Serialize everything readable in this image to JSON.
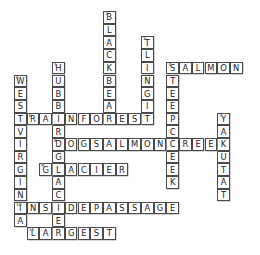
{
  "puzzle": {
    "title": "Crossword Grid",
    "grid": {
      "cols": 19,
      "rows": 19,
      "cell_size": 12.7,
      "origin_x": 14,
      "origin_y": 11
    },
    "colors": {
      "cell_border": "#4a4a4a",
      "cell_fill": "#ffffff",
      "letter": "#1c1c1c",
      "shadow": "#b9b9b9"
    },
    "entries": [
      {
        "id": "blackbear",
        "number": "2",
        "answer": "BLACKBEAR",
        "direction": "down",
        "col": 7,
        "row": 0,
        "length": 9
      },
      {
        "id": "tlingit",
        "number": "3",
        "answer": "TLINGIT",
        "direction": "down",
        "col": 10,
        "row": 2,
        "length": 7
      },
      {
        "id": "salmon",
        "number": "4",
        "answer": "SALMON",
        "direction": "across",
        "col": 12,
        "row": 4,
        "length": 6
      },
      {
        "id": "steepcreek",
        "number": "4",
        "answer": "STEEPCREEK",
        "direction": "down",
        "col": 12,
        "row": 4,
        "length": 10
      },
      {
        "id": "hubbardglacier",
        "number": "1",
        "answer": "HUBBARDGLACIER",
        "direction": "down",
        "col": 3,
        "row": 4,
        "length": 14
      },
      {
        "id": "westvirginia",
        "number": "5",
        "answer": "WESTVIRGINIA",
        "direction": "down",
        "col": 0,
        "row": 5,
        "length": 12
      },
      {
        "id": "rainforest",
        "number": "6",
        "answer": "RAINFOREST",
        "direction": "across",
        "col": 1,
        "row": 8,
        "length": 10
      },
      {
        "id": "yakutat",
        "number": "7",
        "answer": "YAKUTAT",
        "direction": "down",
        "col": 16,
        "row": 8,
        "length": 7
      },
      {
        "id": "dogsalmoncreek",
        "number": "8",
        "answer": "DOGSALMONCREEK",
        "direction": "across",
        "col": 3,
        "row": 10,
        "length": 14
      },
      {
        "id": "glacier",
        "number": "9",
        "answer": "GLACIER",
        "direction": "across",
        "col": 2,
        "row": 12,
        "length": 7
      },
      {
        "id": "insidepassage",
        "number": "10",
        "answer": "INSIDEPASSAGE",
        "direction": "across",
        "col": 0,
        "row": 15,
        "length": 13
      },
      {
        "id": "largest",
        "number": "11",
        "answer": "LARGEST",
        "direction": "across",
        "col": 1,
        "row": 17,
        "length": 7
      }
    ]
  }
}
